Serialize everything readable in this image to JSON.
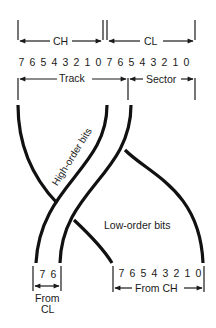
{
  "registers": {
    "top_left": "CH",
    "top_right": "CL",
    "top_bits": [
      "7",
      "6",
      "5",
      "4",
      "3",
      "2",
      "1",
      "0",
      "7",
      "6",
      "5",
      "4",
      "3",
      "2",
      "1",
      "0"
    ],
    "field_left": "Track",
    "field_right": "Sector"
  },
  "band_label": "High-order bits",
  "low_label": "Low-order bits",
  "bottom_left": {
    "bits": [
      "7",
      "6"
    ],
    "label_line1": "From",
    "label_line2": "CL"
  },
  "bottom_right": {
    "bits": [
      "7",
      "6",
      "5",
      "4",
      "3",
      "2",
      "1",
      "0"
    ],
    "label": "From CH"
  },
  "colors": {
    "ink": "#1a1a1a",
    "background": "#ffffff"
  }
}
